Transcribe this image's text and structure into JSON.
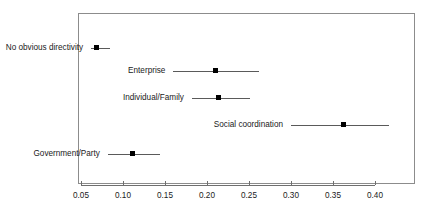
{
  "chart_data": {
    "type": "scatter",
    "title": "",
    "xlabel": "",
    "ylabel": "",
    "orientation": "horizontal",
    "grid": false,
    "legend": false,
    "xlim": [
      0.042,
      0.434
    ],
    "xticks": [
      0.05,
      0.1,
      0.15,
      0.2,
      0.25,
      0.3,
      0.35,
      0.4
    ],
    "xtick_labels": [
      "0.05",
      "0.10",
      "0.15",
      "0.20",
      "0.25",
      "0.30",
      "0.35",
      "0.40"
    ],
    "categories": [
      "No obvious directivity",
      "Enterprise",
      "Individual/Family",
      "Social coordination",
      "Government/Party"
    ],
    "series": [
      {
        "name": "estimate",
        "values": [
          0.068,
          0.21,
          0.214,
          0.363,
          0.111
        ],
        "ci_low": [
          0.062,
          0.16,
          0.182,
          0.3,
          0.082
        ],
        "ci_high": [
          0.085,
          0.262,
          0.251,
          0.417,
          0.144
        ]
      }
    ],
    "points": [
      {
        "label": "No obvious directivity",
        "value": 0.068,
        "ci_low": 0.062,
        "ci_high": 0.085,
        "row_y": 41
      },
      {
        "label": "Enterprise",
        "value": 0.21,
        "ci_low": 0.16,
        "ci_high": 0.262,
        "row_y": 64
      },
      {
        "label": "Individual/Family",
        "value": 0.214,
        "ci_low": 0.182,
        "ci_high": 0.251,
        "row_y": 91
      },
      {
        "label": "Social coordination",
        "value": 0.363,
        "ci_low": 0.3,
        "ci_high": 0.417,
        "row_y": 118
      },
      {
        "label": "Government/Party",
        "value": 0.111,
        "ci_low": 0.082,
        "ci_high": 0.144,
        "row_y": 147
      }
    ]
  },
  "geometry": {
    "px_at_x0": 81,
    "px_per_unit": 840,
    "axis_y": 185,
    "tick_label_y": 191,
    "label_gap": 8
  }
}
